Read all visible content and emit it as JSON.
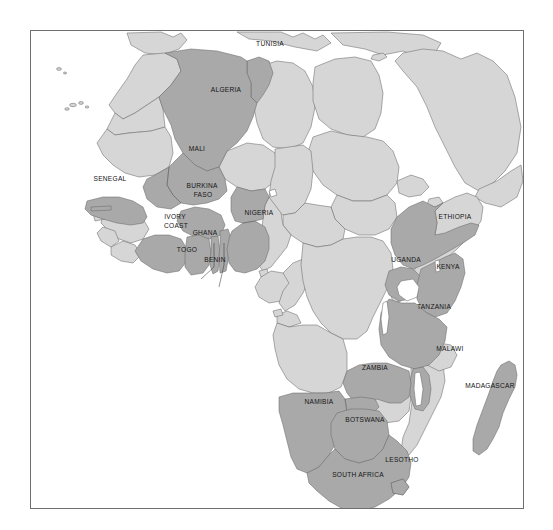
{
  "map": {
    "title": "Africa",
    "projection": "equirectangular",
    "frame": {
      "x": 30,
      "y": 30,
      "width": 494,
      "height": 479,
      "border_color": "#6f6f6f"
    },
    "background_color": "#ffffff",
    "ocean_color": "#ffffff",
    "colors": {
      "highlighted_fill": "#a9a9a9",
      "base_fill": "#d6d6d6",
      "border_stroke": "#6a6a6a",
      "label_text": "#151515",
      "leader_line": "#2a2a2a",
      "frame_border": "#6f6f6f"
    },
    "legend": {
      "highlighted_meaning": "highlighted country",
      "base_meaning": "other country"
    },
    "highlighted_countries": [
      {
        "name": "TUNISIA",
        "label_x": 239,
        "label_y": 43,
        "leader": null
      },
      {
        "name": "ALGERIA",
        "label_x": 195,
        "label_y": 89,
        "leader": null
      },
      {
        "name": "MALI",
        "label_x": 166,
        "label_y": 148,
        "leader": null
      },
      {
        "name": "SENEGAL",
        "label_x": 79,
        "label_y": 178,
        "leader": null
      },
      {
        "name": "BURKINA FASO",
        "label_x": 172,
        "label_y": 190,
        "leader": null
      },
      {
        "name": "IVORY COAST",
        "label_x": 148,
        "label_y": 220,
        "leader": null
      },
      {
        "name": "GHANA",
        "label_x": 172,
        "label_y": 232,
        "leader": null
      },
      {
        "name": "TOGO",
        "label_x": 184,
        "label_y": 249,
        "leader": "togo"
      },
      {
        "name": "BENIN",
        "label_x": 207,
        "label_y": 257,
        "leader": "benin"
      },
      {
        "name": "NIGERIA",
        "label_x": 228,
        "label_y": 212,
        "leader": null
      },
      {
        "name": "ETHIOPIA",
        "label_x": 424,
        "label_y": 216,
        "leader": null
      },
      {
        "name": "UGANDA",
        "label_x": 378,
        "label_y": 259,
        "leader": null
      },
      {
        "name": "KENYA",
        "label_x": 417,
        "label_y": 266,
        "leader": null
      },
      {
        "name": "TANZANIA",
        "label_x": 403,
        "label_y": 306,
        "leader": null
      },
      {
        "name": "MALAWI",
        "label_x": 419,
        "label_y": 348,
        "leader": null
      },
      {
        "name": "ZAMBIA",
        "label_x": 344,
        "label_y": 367,
        "leader": null
      },
      {
        "name": "NAMIBIA",
        "label_x": 288,
        "label_y": 401,
        "leader": null
      },
      {
        "name": "BOTSWANA",
        "label_x": 334,
        "label_y": 419,
        "leader": null
      },
      {
        "name": "LESOTHO",
        "label_x": 371,
        "label_y": 459,
        "leader": null
      },
      {
        "name": "SOUTH AFRICA",
        "label_x": 327,
        "label_y": 474,
        "leader": null
      },
      {
        "name": "MADAGASCAR",
        "label_x": 489,
        "label_y": 385,
        "leader": null
      }
    ],
    "unlabeled_regions": [
      "Morocco",
      "Western Sahara",
      "Mauritania",
      "Libya",
      "Egypt",
      "Sudan",
      "South Sudan",
      "Chad",
      "Niger",
      "Guinea",
      "Guinea-Bissau",
      "Sierra Leone",
      "Liberia",
      "Gambia",
      "Cameroon",
      "Central African Republic",
      "Somalia",
      "Eritrea",
      "Djibouti",
      "Gabon",
      "Congo",
      "DR Congo",
      "Angola",
      "Zimbabwe",
      "Mozambique",
      "Equatorial Guinea",
      "Rwanda",
      "Burundi",
      "Saudi Arabia",
      "Yemen",
      "Oman",
      "Iraq",
      "Syria",
      "Jordan",
      "Israel",
      "Spain",
      "Portugal",
      "Italy",
      "Turkey",
      "Greece",
      "Canary Islands"
    ],
    "water_features": [
      "Lake Victoria",
      "Mediterranean Sea",
      "Red Sea",
      "Atlantic Ocean",
      "Indian Ocean",
      "Persian Gulf"
    ]
  }
}
